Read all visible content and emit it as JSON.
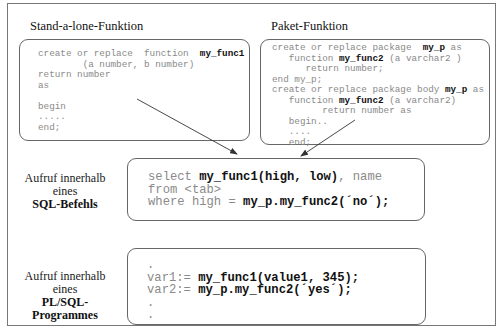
{
  "standalone": {
    "title": "Stand-a-lone-Funktion",
    "lines": [
      [
        {
          "t": "create or replace  function  "
        },
        {
          "t": "my_func1",
          "b": true
        }
      ],
      [
        {
          "t": "        (a number, b number)"
        }
      ],
      [
        {
          "t": "return number"
        }
      ],
      [
        {
          "t": "as"
        }
      ],
      [
        {
          "t": ""
        }
      ],
      [
        {
          "t": "begin"
        }
      ],
      [
        {
          "t": "....."
        }
      ],
      [
        {
          "t": "end;"
        }
      ]
    ]
  },
  "package": {
    "title": "Paket-Funktion",
    "lines": [
      [
        {
          "t": "create or replace package  "
        },
        {
          "t": "my_p",
          "b": true
        },
        {
          "t": " as"
        }
      ],
      [
        {
          "t": "   function "
        },
        {
          "t": "my_func2",
          "b": true
        },
        {
          "t": " (a varchar2 )"
        }
      ],
      [
        {
          "t": "      return number;"
        }
      ],
      [
        {
          "t": "end my_p;"
        }
      ],
      [
        {
          "t": "create or replace package body "
        },
        {
          "t": "my_p",
          "b": true
        },
        {
          "t": " as"
        }
      ],
      [
        {
          "t": "   function "
        },
        {
          "t": "my_func2",
          "b": true
        },
        {
          "t": " (a varchar2)"
        }
      ],
      [
        {
          "t": "         return number as"
        }
      ],
      [
        {
          "t": "   begin.."
        }
      ],
      [
        {
          "t": "   ...."
        }
      ],
      [
        {
          "t": "   end;"
        }
      ]
    ]
  },
  "sql_call": {
    "label_line1": "Aufruf innerhalb",
    "label_line2": "eines",
    "label_line3": "SQL-Befehls",
    "lines": [
      [
        {
          "t": "select "
        },
        {
          "t": "my_func1(high, low)",
          "b": true
        },
        {
          "t": ", name"
        }
      ],
      [
        {
          "t": "from <tab>"
        }
      ],
      [
        {
          "t": "where high = "
        },
        {
          "t": "my_p.my_func2(´no´);",
          "b": true
        }
      ]
    ]
  },
  "plsql_call": {
    "label_line1": "Aufruf innerhalb",
    "label_line2": "eines",
    "label_line3": "PL/SQL-Programmes",
    "lines": [
      [
        {
          "t": "."
        }
      ],
      [
        {
          "t": "var1:= "
        },
        {
          "t": "my_func1(value1, 345);",
          "b": true
        }
      ],
      [
        {
          "t": "var2:= "
        },
        {
          "t": "my_p.my_func2(´yes´);",
          "b": true
        }
      ],
      [
        {
          "t": "."
        }
      ],
      [
        {
          "t": "."
        }
      ]
    ]
  },
  "colors": {
    "frame": "#777777",
    "box_border": "#666666",
    "code_plain": "#8a8a8a",
    "code_bold": "#111111",
    "arrow": "#333333"
  }
}
